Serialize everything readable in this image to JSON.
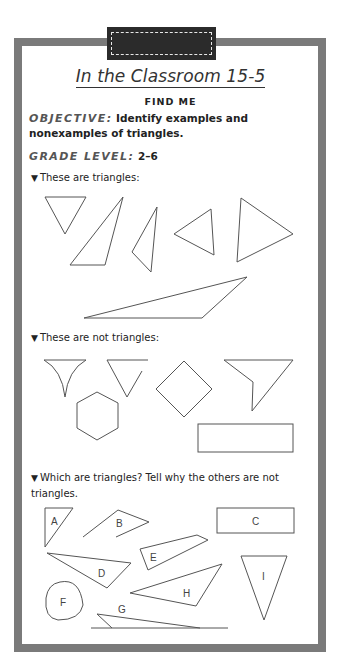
{
  "page": {
    "title": "In the Classroom 15-5",
    "subtitle": "FIND ME",
    "objective_label": "OBJECTIVE:",
    "objective_text": "Identify examples and nonexamples of triangles.",
    "grade_label": "GRADE LEVEL:",
    "grade_value": "2–6"
  },
  "sections": [
    {
      "bullet": "▼",
      "label": "These are triangles:"
    },
    {
      "bullet": "▼",
      "label": "These are not triangles:"
    },
    {
      "bullet": "▼",
      "label": "Which are triangles? Tell why the others are not triangles."
    }
  ],
  "question_shape_labels": [
    "A",
    "B",
    "C",
    "D",
    "E",
    "F",
    "G",
    "H",
    "I"
  ],
  "colors": {
    "frame": "#7a7a7a",
    "badge": "#2b2b2b",
    "stroke": "#555555"
  }
}
